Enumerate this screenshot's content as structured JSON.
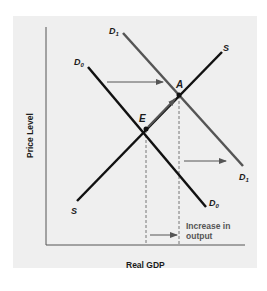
{
  "diagram": {
    "axes": {
      "y_label": "Price Level",
      "x_label": "Real GDP"
    },
    "curves": {
      "supply": {
        "label_top": "S",
        "label_bottom": "S",
        "color": "#111111"
      },
      "demand_initial": {
        "label_top": "D",
        "label_top_sub": "0",
        "label_bottom": "D",
        "label_bottom_sub": "0",
        "color": "#111111"
      },
      "demand_shifted": {
        "label_top": "D",
        "label_top_sub": "1",
        "label_bottom": "D",
        "label_bottom_sub": "1",
        "color": "#555555"
      }
    },
    "points": {
      "initial_equilibrium": "E",
      "new_equilibrium": "A"
    },
    "annotation": {
      "line1": "Increase in",
      "line2": "output"
    },
    "colors": {
      "panel_bg": "#efefef",
      "axis": "#555555",
      "arrow": "#555555",
      "dashed": "#777777"
    }
  }
}
